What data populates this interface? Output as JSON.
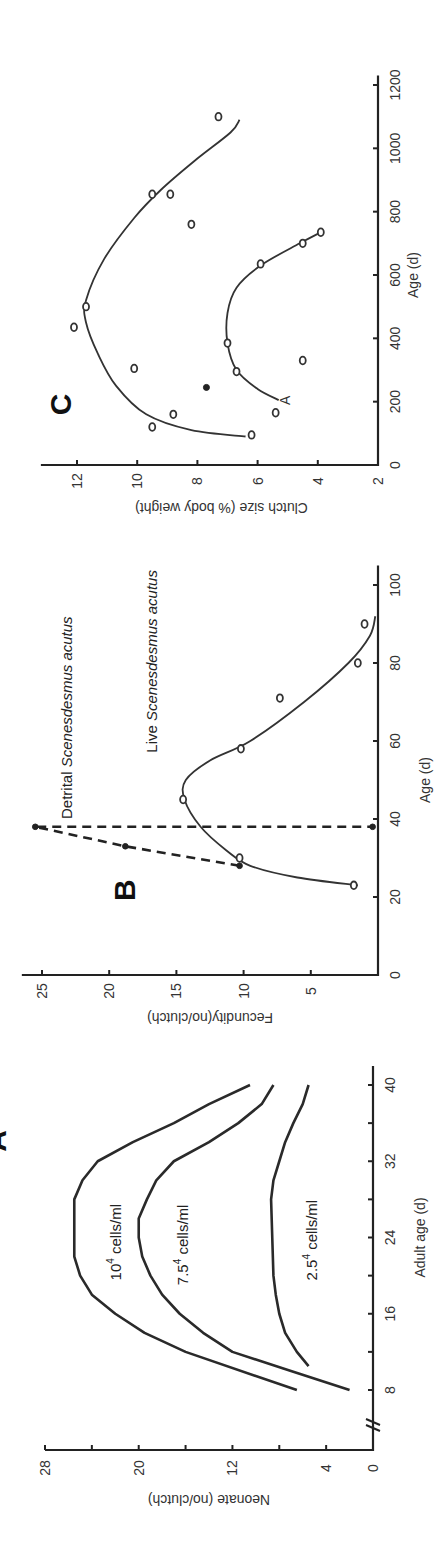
{
  "chart_data": [
    {
      "panel": "A",
      "type": "line",
      "xlabel": "Adult age (d)",
      "ylabel": "Neonate (no/clutch)",
      "xticks": [
        "8",
        "16",
        "24",
        "32",
        "40"
      ],
      "yticks": [
        "0",
        "4",
        "12",
        "20",
        "28"
      ],
      "xlim": [
        4,
        42
      ],
      "ylim": [
        0,
        28
      ],
      "axis_break": true,
      "x": [
        8,
        12,
        14,
        16,
        18,
        20,
        22,
        24,
        26,
        28,
        30,
        32,
        34,
        36,
        38,
        40
      ],
      "series": [
        {
          "name": "10⁴ cells/ml",
          "label_main": "10",
          "label_sup": "4",
          "label_tail": " cells/ml",
          "x": [
            8,
            12,
            14,
            16,
            18,
            20,
            22,
            24,
            26,
            28,
            30,
            32,
            34,
            36,
            38,
            40
          ],
          "values": [
            6.5,
            16,
            19.5,
            22,
            24,
            25,
            25.5,
            25.5,
            25.5,
            25.5,
            24.8,
            23.5,
            20.5,
            17,
            14,
            10.5
          ]
        },
        {
          "name": "7.5⁴ cells/ml",
          "label_main": "7.5",
          "label_sup": "4",
          "label_tail": " cells/ml",
          "x": [
            8,
            10,
            12,
            14,
            16,
            18,
            20,
            22,
            24,
            26,
            28,
            30,
            32,
            34,
            36,
            38,
            40
          ],
          "values": [
            2.0,
            7,
            12,
            14.5,
            16.5,
            18,
            19,
            19.7,
            20,
            20,
            19.3,
            18.5,
            17,
            14,
            11.5,
            9.5,
            8.5
          ]
        },
        {
          "name": "2.5⁴ cells/ml",
          "label_main": "2.5",
          "label_sup": "4",
          "label_tail": " cells/ml",
          "x": [
            10.5,
            12,
            14,
            16,
            18,
            20,
            24,
            28,
            30,
            32,
            34,
            36,
            38,
            40
          ],
          "values": [
            5.5,
            6.5,
            7.5,
            8.0,
            8.3,
            8.5,
            8.6,
            8.7,
            8.5,
            8.0,
            7.5,
            6.8,
            6.0,
            5.5
          ]
        }
      ]
    },
    {
      "panel": "B",
      "type": "line",
      "xlabel": "Age (d)",
      "ylabel": "Fecundity(no/clutch)",
      "xticks": [
        "0",
        "20",
        "40",
        "60",
        "80",
        "100"
      ],
      "yticks": [
        "5",
        "10",
        "15",
        "20",
        "25"
      ],
      "xlim": [
        0,
        105
      ],
      "ylim": [
        0,
        26.5
      ],
      "series": [
        {
          "name": "Live Scenesdesmus acutus",
          "label_plain": "Live ",
          "label_italic": "Scenesdesmus acutus",
          "style": "solid",
          "points": [
            [
              23,
              1.8
            ],
            [
              30,
              10.3
            ],
            [
              45,
              14.5
            ],
            [
              58,
              10.2
            ],
            [
              71,
              7.3
            ],
            [
              80,
              1.5
            ],
            [
              90,
              1.0
            ]
          ],
          "curve": [
            [
              23,
              1.5
            ],
            [
              25,
              6
            ],
            [
              28,
              9.5
            ],
            [
              32,
              11.3
            ],
            [
              38,
              13.2
            ],
            [
              45,
              14.4
            ],
            [
              50,
              14.3
            ],
            [
              55,
              12.5
            ],
            [
              60,
              9.5
            ],
            [
              70,
              5.5
            ],
            [
              80,
              2.2
            ],
            [
              87,
              0.6
            ],
            [
              92,
              0.2
            ]
          ]
        },
        {
          "name": "Detrital Scenesdesmus acutus",
          "label_plain": "Detrital ",
          "label_italic": "Scenesdesmus acutus",
          "style": "dashed",
          "points": [
            [
              28,
              10.3
            ],
            [
              33,
              18.8
            ],
            [
              38,
              25.5
            ],
            [
              38,
              0.4
            ]
          ],
          "curve": [
            [
              28,
              10.3
            ],
            [
              33,
              18.8
            ],
            [
              38,
              25.5
            ],
            [
              38,
              0.4
            ]
          ]
        }
      ]
    },
    {
      "panel": "C",
      "type": "scatter",
      "xlabel": "Age (d)",
      "ylabel": "Clutch size (% body weight)",
      "xticks": [
        "0",
        "200",
        "400",
        "600",
        "800",
        "1000",
        "1200"
      ],
      "yticks": [
        "2",
        "4",
        "6",
        "8",
        "10",
        "12"
      ],
      "xlim": [
        0,
        1230
      ],
      "ylim": [
        2,
        13.2
      ],
      "annotation": "A",
      "series": [
        {
          "name": "upper",
          "points": [
            [
              95,
              6.2
            ],
            [
              120,
              9.5
            ],
            [
              160,
              8.8
            ],
            [
              305,
              10.1
            ],
            [
              435,
              12.1
            ],
            [
              500,
              11.7
            ],
            [
              760,
              8.2
            ],
            [
              855,
              9.5
            ],
            [
              855,
              8.9
            ],
            [
              1100,
              7.3
            ]
          ],
          "curve": [
            [
              90,
              6.4
            ],
            [
              110,
              8.2
            ],
            [
              160,
              9.7
            ],
            [
              250,
              10.7
            ],
            [
              350,
              11.3
            ],
            [
              450,
              11.7
            ],
            [
              520,
              11.7
            ],
            [
              650,
              11.1
            ],
            [
              780,
              10.1
            ],
            [
              870,
              9.2
            ],
            [
              960,
              8.1
            ],
            [
              1050,
              6.9
            ],
            [
              1090,
              6.6
            ]
          ]
        },
        {
          "name": "lower",
          "points": [
            [
              165,
              5.4
            ],
            [
              295,
              6.7
            ],
            [
              330,
              4.5
            ],
            [
              385,
              7.0
            ],
            [
              635,
              5.9
            ],
            [
              700,
              4.5
            ],
            [
              735,
              3.9
            ]
          ],
          "curve": [
            [
              205,
              5.3
            ],
            [
              240,
              6.0
            ],
            [
              300,
              6.7
            ],
            [
              385,
              7.0
            ],
            [
              480,
              7.0
            ],
            [
              560,
              6.7
            ],
            [
              630,
              5.9
            ],
            [
              700,
              4.6
            ],
            [
              735,
              3.9
            ]
          ]
        },
        {
          "name": "filled point",
          "points": [
            [
              245,
              7.7
            ]
          ]
        }
      ]
    }
  ],
  "panels": {
    "a_label": "A",
    "b_label": "B",
    "c_label": "C"
  }
}
